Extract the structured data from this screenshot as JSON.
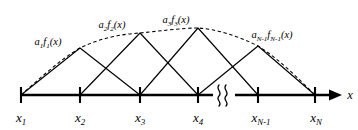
{
  "figure": {
    "type": "diagram",
    "axis": {
      "label": "x",
      "arrow_direction": "right",
      "has_break": true,
      "break_symbol": "double-squiggle"
    },
    "nodes": [
      {
        "id": "x1",
        "base": "x",
        "sub": "1",
        "x_px": 21,
        "label_y_px": 122
      },
      {
        "id": "x2",
        "base": "x",
        "sub": "2",
        "x_px": 80,
        "label_y_px": 122
      },
      {
        "id": "x3",
        "base": "x",
        "sub": "3",
        "x_px": 140,
        "label_y_px": 122
      },
      {
        "id": "x4",
        "base": "x",
        "sub": "4",
        "x_px": 198,
        "label_y_px": 122
      },
      {
        "id": "xNm1",
        "base": "x",
        "sub": "N-1",
        "x_px": 258,
        "label_y_px": 122
      },
      {
        "id": "xN",
        "base": "x",
        "sub": "N",
        "x_px": 315,
        "label_y_px": 122
      }
    ],
    "basis_functions": [
      {
        "id": "a1f1",
        "coefficient": "a",
        "coefficient_sub": "1",
        "function": "f",
        "function_sub": "1",
        "argument": "(x)",
        "peak_node": "x2",
        "peak_x_px": 80,
        "peak_y_px": 48,
        "left_x_px": 21,
        "right_x_px": 140,
        "label_x_px": 48,
        "label_y_px": 45
      },
      {
        "id": "a2f2",
        "coefficient": "a",
        "coefficient_sub": "2",
        "function": "f",
        "function_sub": "2",
        "argument": "(x)",
        "peak_node": "x3",
        "peak_x_px": 140,
        "peak_y_px": 33,
        "left_x_px": 80,
        "right_x_px": 198,
        "label_x_px": 112,
        "label_y_px": 28
      },
      {
        "id": "a3f3",
        "coefficient": "a",
        "coefficient_sub": "3",
        "function": "f",
        "function_sub": "3",
        "argument": "(x)",
        "peak_node": "x4",
        "peak_x_px": 198,
        "peak_y_px": 28,
        "left_x_px": 140,
        "right_x_px": 258,
        "label_x_px": 176,
        "label_y_px": 23
      },
      {
        "id": "aNm1fNm1",
        "coefficient": "a",
        "coefficient_sub": "N-1",
        "function": "f",
        "function_sub": "N-1",
        "argument": "(x)",
        "peak_node": "xNm1",
        "peak_x_px": 258,
        "peak_y_px": 46,
        "left_x_px": 198,
        "right_x_px": 315,
        "label_x_px": 240,
        "label_y_px": 38
      }
    ],
    "envelope": {
      "id": "sum-envelope",
      "style": "dashed",
      "description": "dashed curve through the peaks of the scaled basis functions",
      "points_px": [
        [
          21,
          95
        ],
        [
          50,
          62
        ],
        [
          80,
          48
        ],
        [
          110,
          38
        ],
        [
          140,
          33
        ],
        [
          170,
          29
        ],
        [
          198,
          28
        ],
        [
          228,
          33
        ],
        [
          258,
          46
        ],
        [
          288,
          68
        ],
        [
          315,
          95
        ]
      ]
    },
    "colors": {
      "stroke": "#000000",
      "background": "#ffffff"
    }
  }
}
